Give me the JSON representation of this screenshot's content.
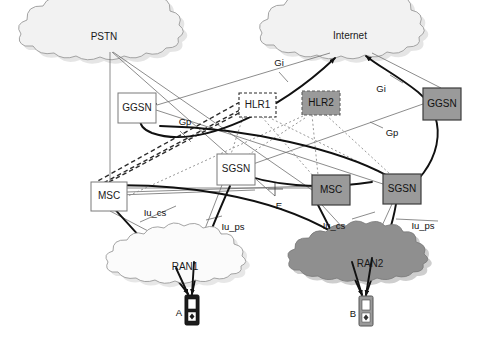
{
  "diagram": {
    "background_color": "#ffffff",
    "colors": {
      "line": "#3a3a3a",
      "thick_line": "#111111",
      "thin_line": "#6e6e6e",
      "dashed_line": "#2b2b2b",
      "dotted_line": "#8d8d8d",
      "box_fill_white": "#ffffff",
      "box_fill_gray": "#9a9a9a",
      "box_stroke_thin": "#7a7a7a",
      "box_stroke_dark": "#3c3c3c",
      "cloud_fill_light": "#f2f2f2",
      "cloud_fill_gray": "#8f8f8f",
      "cloud_stroke": "#9a9a9a",
      "shadow": "#cfcfcf",
      "text": "#111111",
      "handset_body_dark": "#1c1c1c",
      "handset_body_gray": "#9a9a9a",
      "handset_screen": "#ffffff"
    },
    "clouds": [
      {
        "id": "pstn",
        "label": "PSTN",
        "fill": "light",
        "cx": 104,
        "cy": 37
      },
      {
        "id": "internet",
        "label": "Internet",
        "fill": "light",
        "cx": 350,
        "cy": 36
      },
      {
        "id": "ran1",
        "label": "RAN1",
        "fill": "light",
        "cx": 185,
        "cy": 267
      },
      {
        "id": "ran2",
        "label": "RAN2",
        "fill": "gray",
        "cx": 370,
        "cy": 264
      }
    ],
    "nodes": [
      {
        "id": "ggsn-left",
        "label": "GGSN",
        "style": "white-solid",
        "x": 118,
        "y": 93,
        "w": 38,
        "h": 30
      },
      {
        "id": "hlr1",
        "label": "HLR1",
        "style": "white-dashed",
        "x": 239,
        "y": 93,
        "w": 37,
        "h": 24
      },
      {
        "id": "hlr2",
        "label": "HLR2",
        "style": "gray-dashed",
        "x": 302,
        "y": 91,
        "w": 38,
        "h": 24
      },
      {
        "id": "ggsn-right",
        "label": "GGSN",
        "style": "gray-solid",
        "x": 423,
        "y": 88,
        "w": 38,
        "h": 32
      },
      {
        "id": "sgsn-left",
        "label": "SGSN",
        "style": "white-solid",
        "x": 217,
        "y": 154,
        "w": 38,
        "h": 31
      },
      {
        "id": "msc-left",
        "label": "MSC",
        "style": "white-solid",
        "x": 91,
        "y": 182,
        "w": 36,
        "h": 29
      },
      {
        "id": "msc-right",
        "label": "MSC",
        "style": "gray-solid",
        "x": 312,
        "y": 175,
        "w": 38,
        "h": 30
      },
      {
        "id": "sgsn-right",
        "label": "SGSN",
        "style": "gray-solid",
        "x": 383,
        "y": 174,
        "w": 38,
        "h": 30
      }
    ],
    "interface_labels": [
      {
        "id": "gi-left",
        "text": "Gi",
        "x": 279,
        "y": 63
      },
      {
        "id": "gi-right",
        "text": "Gi",
        "x": 381,
        "y": 89
      },
      {
        "id": "gp-left",
        "text": "Gp",
        "x": 185,
        "y": 122
      },
      {
        "id": "gp-right",
        "text": "Gp",
        "x": 392,
        "y": 133
      },
      {
        "id": "e-label",
        "text": "E",
        "x": 279,
        "y": 206
      },
      {
        "id": "iu-cs-left",
        "text": "Iu_cs",
        "x": 155,
        "y": 213
      },
      {
        "id": "iu-ps-left",
        "text": "Iu_ps",
        "x": 233,
        "y": 227
      },
      {
        "id": "iu-cs-right",
        "text": "Iu_cs",
        "x": 334,
        "y": 226
      },
      {
        "id": "iu-ps-right",
        "text": "Iu_ps",
        "x": 423,
        "y": 226
      }
    ],
    "terminals": [
      {
        "id": "ue-a",
        "label": "A",
        "style": "dark",
        "x": 189,
        "y": 296,
        "label_x": 179,
        "label_y": 313
      },
      {
        "id": "ue-b",
        "label": "B",
        "style": "gray",
        "x": 363,
        "y": 297,
        "label_x": 353,
        "label_y": 314
      }
    ]
  }
}
